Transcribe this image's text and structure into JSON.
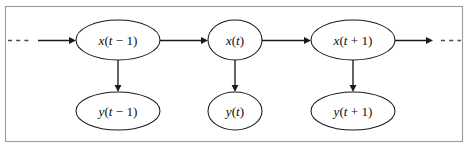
{
  "figure": {
    "background_color": "#ffffff",
    "frame_color": "#9a9a9a",
    "ink_color": "#1a1a1a"
  },
  "diagram_data": {
    "type": "diagram",
    "layout": "two-row chain (state row over observation row)",
    "nodes": [
      {
        "id": "x_tm1",
        "label": "x(t − 1)",
        "var": "x",
        "arg": "(t − 1)",
        "row": "state",
        "cx": 118,
        "cy": 40,
        "rx": 42,
        "ry": 20
      },
      {
        "id": "x_t",
        "label": "x(t)",
        "var": "x",
        "arg": "(t)",
        "row": "state",
        "cx": 235,
        "cy": 40,
        "rx": 27,
        "ry": 20
      },
      {
        "id": "x_tp1",
        "label": "x(t + 1)",
        "var": "x",
        "arg": "(t + 1)",
        "row": "state",
        "cx": 353,
        "cy": 40,
        "rx": 42,
        "ry": 20
      },
      {
        "id": "y_tm1",
        "label": "y(t − 1)",
        "var": "y",
        "arg": "(t − 1)",
        "row": "observation",
        "cx": 118,
        "cy": 111,
        "rx": 42,
        "ry": 19
      },
      {
        "id": "y_t",
        "label": "y(t)",
        "var": "y",
        "arg": "(t)",
        "row": "observation",
        "cx": 235,
        "cy": 111,
        "rx": 27,
        "ry": 19
      },
      {
        "id": "y_tp1",
        "label": "y(t + 1)",
        "var": "y",
        "arg": "(t + 1)",
        "row": "observation",
        "cx": 353,
        "cy": 111,
        "rx": 42,
        "ry": 19
      }
    ],
    "edges": [
      {
        "id": "e_in",
        "from": "past",
        "to": "x_tm1",
        "style": "solid",
        "direction": "right"
      },
      {
        "id": "e_x_tm1_x_t",
        "from": "x_tm1",
        "to": "x_t",
        "style": "solid",
        "direction": "right"
      },
      {
        "id": "e_x_t_x_tp1",
        "from": "x_t",
        "to": "x_tp1",
        "style": "solid",
        "direction": "right"
      },
      {
        "id": "e_out",
        "from": "x_tp1",
        "to": "future",
        "style": "solid",
        "direction": "right"
      },
      {
        "id": "e_x_tm1_y_tm1",
        "from": "x_tm1",
        "to": "y_tm1",
        "style": "solid",
        "direction": "down"
      },
      {
        "id": "e_x_t_y_t",
        "from": "x_t",
        "to": "y_t",
        "style": "solid",
        "direction": "down"
      },
      {
        "id": "e_x_tp1_y_tp1",
        "from": "x_tp1",
        "to": "y_tp1",
        "style": "solid",
        "direction": "down"
      },
      {
        "id": "e_dash_left",
        "from": "past",
        "to": "past",
        "style": "dashed",
        "direction": "none"
      },
      {
        "id": "e_dash_right",
        "from": "future",
        "to": "future",
        "style": "dashed",
        "direction": "none"
      }
    ],
    "continuation_marks": {
      "left": "····",
      "right": "····"
    }
  }
}
